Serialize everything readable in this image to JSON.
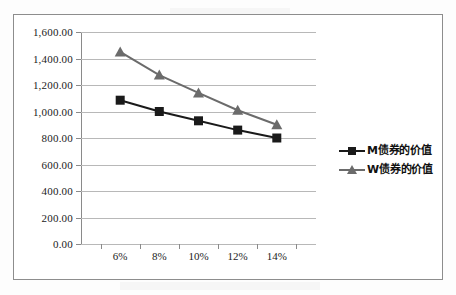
{
  "chart_data": {
    "type": "line",
    "title": "",
    "xlabel": "",
    "ylabel": "",
    "categories": [
      "6%",
      "8%",
      "10%",
      "12%",
      "14%"
    ],
    "ylim": [
      0,
      1600
    ],
    "ytick_values": [
      0,
      200,
      400,
      600,
      800,
      1000,
      1200,
      1400,
      1600
    ],
    "ytick_labels": [
      "0.00",
      "200.00",
      "400.00",
      "600.00",
      "800.00",
      "1,000.00",
      "1,200.00",
      "1,400.00",
      "1,600.00"
    ],
    "grid": true,
    "legend_position": "right",
    "series": [
      {
        "name": "M债券的价值",
        "marker": "square",
        "color": "#1a1a1a",
        "values": [
          1085,
          1000,
          930,
          860,
          800
        ]
      },
      {
        "name": "W债券的价值",
        "marker": "triangle",
        "color": "#6b6b6b",
        "values": [
          1450,
          1275,
          1140,
          1010,
          900
        ]
      }
    ]
  },
  "legend": {
    "items": [
      {
        "label": "M债券的价值",
        "marker": "square-marker",
        "color": "#1a1a1a"
      },
      {
        "label": "W债券的价值",
        "marker": "triangle-marker",
        "color": "#6b6b6b"
      }
    ]
  }
}
